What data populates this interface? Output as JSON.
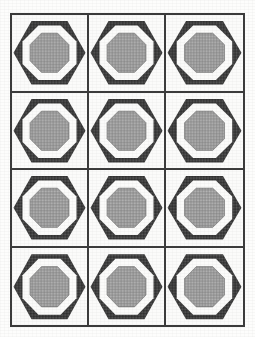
{
  "document": {
    "kind": "quilt-block-pattern-diagram",
    "title": "",
    "caption": "",
    "page_background": "#fdfdfc",
    "frame": {
      "border_color": "#3a3a3a",
      "border_width_px": 2,
      "fill": "#fbfbfa",
      "left_px": 10,
      "top_px": 13,
      "width_px": 235,
      "height_px": 314
    }
  },
  "grid": {
    "columns": 3,
    "rows": 4,
    "total_blocks": 12,
    "gridline_color": "#3a3a3a",
    "gridline_width_px": 2
  },
  "palette": {
    "dark": "#3b3b3b",
    "mid_gray": "#9a9a9a",
    "light": "#fbfbfa",
    "outline": "#3a3a3a",
    "paper": "#fdfdfc"
  },
  "block_design": {
    "name": "octagon-in-hexagon",
    "layers": [
      {
        "shape": "hexagon",
        "tone": "dark",
        "texture": "dense-dither",
        "note": "points at left and right, flat top and bottom"
      },
      {
        "shape": "octagon",
        "tone": "light",
        "texture": "solid",
        "note": "white ring between hexagon and center"
      },
      {
        "shape": "octagon",
        "tone": "mid_gray",
        "texture": "checker-dither",
        "note": "shaded center medallion"
      }
    ]
  },
  "blocks": [
    {
      "row": 1,
      "col": 1,
      "design": "octagon-in-hexagon"
    },
    {
      "row": 1,
      "col": 2,
      "design": "octagon-in-hexagon"
    },
    {
      "row": 1,
      "col": 3,
      "design": "octagon-in-hexagon"
    },
    {
      "row": 2,
      "col": 1,
      "design": "octagon-in-hexagon"
    },
    {
      "row": 2,
      "col": 2,
      "design": "octagon-in-hexagon"
    },
    {
      "row": 2,
      "col": 3,
      "design": "octagon-in-hexagon"
    },
    {
      "row": 3,
      "col": 1,
      "design": "octagon-in-hexagon"
    },
    {
      "row": 3,
      "col": 2,
      "design": "octagon-in-hexagon"
    },
    {
      "row": 3,
      "col": 3,
      "design": "octagon-in-hexagon"
    },
    {
      "row": 4,
      "col": 1,
      "design": "octagon-in-hexagon"
    },
    {
      "row": 4,
      "col": 2,
      "design": "octagon-in-hexagon"
    },
    {
      "row": 4,
      "col": 3,
      "design": "octagon-in-hexagon"
    }
  ]
}
